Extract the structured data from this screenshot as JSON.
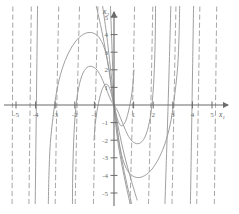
{
  "figure": {
    "title": "",
    "background_color": "#ffffff",
    "curve_color": "#9a9a9a",
    "axis_color": "#6b6b6b",
    "label_color": "#6b6b6b"
  },
  "axes": {
    "x": {
      "name": "x",
      "subscript": "1",
      "label": "x₁",
      "min": -5.6,
      "max": 5.6,
      "ticks": [
        -5,
        -4,
        -3,
        -2,
        -1,
        1,
        2,
        3,
        4,
        5
      ],
      "tick_labels": [
        "-5",
        "-4",
        "-3",
        "-2",
        "-1",
        "1",
        "2",
        "3",
        "4",
        "5"
      ],
      "arrow": true
    },
    "y": {
      "name": "x",
      "subscript": "2",
      "label": "x₂",
      "min": -5.6,
      "max": 5.6,
      "ticks": [
        -5,
        -4,
        -3,
        -2,
        -1,
        1,
        2,
        3,
        4,
        5
      ],
      "tick_labels": [
        "-5",
        "-4",
        "-3",
        "-2",
        "-1",
        "1",
        "2",
        "3",
        "4",
        "5"
      ],
      "arrow": true
    }
  },
  "chart_data": {
    "type": "line",
    "title": "",
    "xlabel": "x₁",
    "ylabel": "x₂",
    "xlim": [
      -5.6,
      5.6
    ],
    "ylim": [
      -5.6,
      5.6
    ],
    "grid": false,
    "legend": "none",
    "plot_kind": "phase-portrait",
    "equilibrium_points": [
      {
        "x": 0,
        "y": 0,
        "type": "degenerate-node"
      }
    ],
    "series": [
      {
        "name": "arc-outer-upper-left",
        "style": "solid",
        "points": [
          [
            -3.35,
            -5.6
          ],
          [
            -3.32,
            -4.0
          ],
          [
            -3.25,
            -2.2
          ],
          [
            -3.1,
            -0.6
          ],
          [
            -2.92,
            0.8
          ],
          [
            -2.66,
            2.0
          ],
          [
            -2.3,
            3.0
          ],
          [
            -1.88,
            3.72
          ],
          [
            -1.44,
            4.08
          ],
          [
            -1.04,
            4.08
          ],
          [
            -0.7,
            3.74
          ],
          [
            -0.44,
            3.05
          ],
          [
            -0.26,
            2.1
          ],
          [
            -0.14,
            1.05
          ],
          [
            -0.06,
            0.3
          ],
          [
            0,
            0
          ]
        ]
      },
      {
        "name": "arc-inner-upper-left",
        "style": "solid",
        "points": [
          [
            -2.12,
            -5.6
          ],
          [
            -2.1,
            -3.6
          ],
          [
            -2.04,
            -1.6
          ],
          [
            -1.95,
            -0.2
          ],
          [
            -1.8,
            1.0
          ],
          [
            -1.58,
            1.82
          ],
          [
            -1.3,
            2.18
          ],
          [
            -1.0,
            2.12
          ],
          [
            -0.74,
            1.78
          ],
          [
            -0.52,
            1.25
          ],
          [
            -0.32,
            0.7
          ],
          [
            -0.16,
            0.28
          ],
          [
            0,
            0
          ]
        ]
      },
      {
        "name": "arc-innermost-upper-left",
        "style": "solid",
        "points": [
          [
            -1.02,
            -2.0
          ],
          [
            -0.96,
            -1.1
          ],
          [
            -0.86,
            -0.3
          ],
          [
            -0.72,
            0.45
          ],
          [
            -0.58,
            0.95
          ],
          [
            -0.42,
            1.18
          ],
          [
            -0.28,
            1.08
          ],
          [
            -0.17,
            0.78
          ],
          [
            -0.09,
            0.42
          ],
          [
            0,
            0
          ]
        ]
      },
      {
        "name": "arc-outer-lower-right",
        "style": "solid",
        "points": [
          [
            0,
            0
          ],
          [
            0.06,
            -0.3
          ],
          [
            0.14,
            -1.05
          ],
          [
            0.26,
            -2.1
          ],
          [
            0.44,
            -3.05
          ],
          [
            0.7,
            -3.74
          ],
          [
            1.04,
            -4.08
          ],
          [
            1.44,
            -4.08
          ],
          [
            1.88,
            -3.72
          ],
          [
            2.3,
            -3.0
          ],
          [
            2.66,
            -2.0
          ],
          [
            2.92,
            -0.8
          ],
          [
            3.1,
            0.6
          ],
          [
            3.25,
            2.2
          ],
          [
            3.32,
            4.0
          ],
          [
            3.35,
            5.6
          ]
        ]
      },
      {
        "name": "arc-inner-lower-right",
        "style": "solid",
        "points": [
          [
            0,
            0
          ],
          [
            0.16,
            -0.28
          ],
          [
            0.32,
            -0.7
          ],
          [
            0.52,
            -1.25
          ],
          [
            0.74,
            -1.78
          ],
          [
            1.0,
            -2.12
          ],
          [
            1.3,
            -2.18
          ],
          [
            1.58,
            -1.82
          ],
          [
            1.8,
            -1.0
          ],
          [
            1.95,
            0.2
          ],
          [
            2.04,
            1.6
          ],
          [
            2.1,
            3.6
          ],
          [
            2.12,
            5.6
          ]
        ]
      },
      {
        "name": "arc-innermost-lower-right",
        "style": "solid",
        "points": [
          [
            0,
            0
          ],
          [
            0.09,
            -0.42
          ],
          [
            0.17,
            -0.78
          ],
          [
            0.28,
            -1.08
          ],
          [
            0.42,
            -1.18
          ],
          [
            0.58,
            -0.95
          ],
          [
            0.72,
            -0.45
          ],
          [
            0.86,
            0.3
          ],
          [
            0.96,
            1.1
          ],
          [
            1.02,
            2.0
          ]
        ]
      },
      {
        "name": "separatrix-steep-left",
        "style": "solid",
        "points": [
          [
            -0.9,
            5.6
          ],
          [
            -0.62,
            4.2
          ],
          [
            -0.4,
            2.9
          ],
          [
            -0.22,
            1.7
          ],
          [
            -0.09,
            0.7
          ],
          [
            0,
            0
          ],
          [
            0.26,
            -1.5
          ],
          [
            0.54,
            -2.9
          ],
          [
            0.86,
            -4.2
          ],
          [
            1.18,
            -5.4
          ]
        ]
      },
      {
        "name": "separatrix-steep-right",
        "style": "solid",
        "points": [
          [
            -0.58,
            5.6
          ],
          [
            -0.4,
            4.2
          ],
          [
            -0.26,
            2.9
          ],
          [
            -0.14,
            1.7
          ],
          [
            -0.05,
            0.7
          ],
          [
            0,
            0
          ],
          [
            0.18,
            -1.6
          ],
          [
            0.4,
            -3.1
          ],
          [
            0.66,
            -4.5
          ],
          [
            0.9,
            -5.6
          ]
        ]
      },
      {
        "name": "trajectory-near-axis",
        "style": "solid",
        "points": [
          [
            -0.18,
            5.6
          ],
          [
            -0.12,
            3.8
          ],
          [
            -0.07,
            2.2
          ],
          [
            -0.03,
            1.0
          ],
          [
            0,
            0
          ],
          [
            0.1,
            -1.2
          ],
          [
            0.24,
            -2.4
          ],
          [
            0.42,
            -3.5
          ],
          [
            0.62,
            -4.6
          ],
          [
            0.82,
            -5.6
          ]
        ]
      },
      {
        "name": "vertical-line-x-minus-5p2",
        "style": "dashed",
        "points": [
          [
            -5.2,
            -5.6
          ],
          [
            -5.18,
            0
          ],
          [
            -5.16,
            5.6
          ]
        ]
      },
      {
        "name": "vertical-line-x-minus-4p3",
        "style": "dashed",
        "points": [
          [
            -4.34,
            -5.6
          ],
          [
            -4.28,
            0
          ],
          [
            -4.22,
            5.6
          ]
        ]
      },
      {
        "name": "vertical-line-x-minus-4p0",
        "style": "solid",
        "points": [
          [
            -4.02,
            -5.6
          ],
          [
            -3.96,
            0
          ],
          [
            -3.9,
            5.6
          ]
        ]
      },
      {
        "name": "vertical-line-x-minus-3p0",
        "style": "dashed",
        "points": [
          [
            -3.0,
            -5.6
          ],
          [
            -2.92,
            0
          ],
          [
            -2.82,
            5.6
          ]
        ]
      },
      {
        "name": "vertical-line-x-minus-2p0",
        "style": "dashed",
        "points": [
          [
            -1.98,
            -5.6
          ],
          [
            -1.88,
            0
          ],
          [
            -1.76,
            5.6
          ]
        ]
      },
      {
        "name": "vertical-line-x-minus-1p0",
        "style": "dashed",
        "points": [
          [
            -1.05,
            -5.6
          ],
          [
            -0.95,
            0
          ],
          [
            -0.82,
            5.6
          ]
        ]
      },
      {
        "name": "vertical-line-x-plus-1p0",
        "style": "dashed",
        "points": [
          [
            0.82,
            -5.6
          ],
          [
            0.95,
            0
          ],
          [
            1.05,
            5.6
          ]
        ]
      },
      {
        "name": "vertical-line-x-plus-2p0",
        "style": "dashed",
        "points": [
          [
            1.76,
            -5.6
          ],
          [
            1.88,
            0
          ],
          [
            1.98,
            5.6
          ]
        ]
      },
      {
        "name": "vertical-line-x-plus-2p9",
        "style": "solid",
        "points": [
          [
            2.6,
            -5.6
          ],
          [
            2.76,
            0
          ],
          [
            2.9,
            5.6
          ]
        ]
      },
      {
        "name": "vertical-line-x-plus-3p1",
        "style": "dashed",
        "points": [
          [
            2.96,
            -5.6
          ],
          [
            3.06,
            0
          ],
          [
            3.16,
            5.6
          ]
        ]
      },
      {
        "name": "vertical-line-x-plus-4p0",
        "style": "solid",
        "points": [
          [
            3.9,
            -5.6
          ],
          [
            3.98,
            0
          ],
          [
            4.06,
            5.6
          ]
        ]
      },
      {
        "name": "vertical-line-x-plus-4p3",
        "style": "dashed",
        "points": [
          [
            4.22,
            -5.6
          ],
          [
            4.3,
            0
          ],
          [
            4.38,
            5.6
          ]
        ]
      },
      {
        "name": "vertical-line-x-plus-5p2",
        "style": "dashed",
        "points": [
          [
            5.12,
            -5.6
          ],
          [
            5.18,
            0
          ],
          [
            5.24,
            5.6
          ]
        ]
      }
    ]
  }
}
